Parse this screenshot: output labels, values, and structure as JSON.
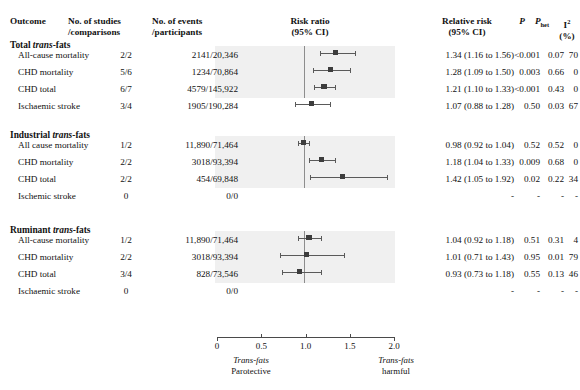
{
  "header": {
    "outcome": "Outcome",
    "studies_l1": "No. of studies",
    "studies_l2": "/comparisons",
    "events_l1": "No. of events",
    "events_l2": "/participants",
    "risk_l1": "Risk ratio",
    "risk_l2": "(95% CI)",
    "rr_l1": "Relative risk",
    "rr_l2": "(95% CI)",
    "p": "P",
    "phet_main": "P",
    "phet_sub": "het",
    "i2_main": "I",
    "i2_sup": "2",
    "i2_l2": "(%)"
  },
  "axis": {
    "ticks": [
      "0",
      "0.5",
      "1.0",
      "1.5",
      "2.0"
    ],
    "tick_values": [
      0,
      0.5,
      1.0,
      1.5,
      2.0
    ],
    "min": 0,
    "max": 2,
    "null_value": 1.0,
    "left_cap_l1": "Trans-fats",
    "left_cap_l2": "Parotective",
    "right_cap_l1": "Trans-fats",
    "right_cap_l2": "harmful"
  },
  "colors": {
    "panel_background": "#f0f0f0",
    "marker": "#3d3d3d",
    "ci_line": "#5a5a5a",
    "null_line": "#8d8d8d",
    "text": "#111111"
  },
  "chart_data": {
    "type": "forest",
    "title": "Risk ratio (95% CI)",
    "xlabel": "Risk ratio",
    "xlim": [
      0,
      2
    ],
    "null_line": 1.0,
    "groups": [
      {
        "title_bold": "Total ",
        "title_italic": "trans",
        "title_tail": "-fats",
        "rows": [
          {
            "outcome": "All-cause mortality",
            "studies": "2/2",
            "events": "2141/20,346",
            "rr_text": "1.34 (1.16 to 1.56)",
            "estimate": 1.34,
            "lower": 1.16,
            "upper": 1.56,
            "p": "<0.001",
            "phet": "0.07",
            "i2": "70"
          },
          {
            "outcome": "CHD mortality",
            "studies": "5/6",
            "events": "1234/70,864",
            "rr_text": "1.28 (1.09 to 1.50)",
            "estimate": 1.28,
            "lower": 1.09,
            "upper": 1.5,
            "p": "0.003",
            "phet": "0.66",
            "i2": "0"
          },
          {
            "outcome": "CHD total",
            "studies": "6/7",
            "events": "4579/145,922",
            "rr_text": "1.21 (1.10 to 1.33)",
            "estimate": 1.21,
            "lower": 1.1,
            "upper": 1.33,
            "p": "<0.001",
            "phet": "0.43",
            "i2": "0"
          },
          {
            "outcome": "Ischaemic stroke",
            "studies": "3/4",
            "events": "1905/190,284",
            "rr_text": "1.07 (0.88 to 1.28)",
            "estimate": 1.07,
            "lower": 0.88,
            "upper": 1.28,
            "p": "0.50",
            "phet": "0.03",
            "i2": "67"
          }
        ]
      },
      {
        "title_bold": "Industrial ",
        "title_italic": "trans",
        "title_tail": "-fats",
        "rows": [
          {
            "outcome": "All cause mortality",
            "studies": "1/2",
            "events": "11,890/71,464",
            "rr_text": "0.98 (0.92 to 1.04)",
            "estimate": 0.98,
            "lower": 0.92,
            "upper": 1.04,
            "p": "0.52",
            "phet": "0.52",
            "i2": "0"
          },
          {
            "outcome": "CHD mortality",
            "studies": "2/2",
            "events": "3018/93,394",
            "rr_text": "1.18 (1.04 to 1.33)",
            "estimate": 1.18,
            "lower": 1.04,
            "upper": 1.33,
            "p": "0.009",
            "phet": "0.68",
            "i2": "0"
          },
          {
            "outcome": "CHD total",
            "studies": "2/2",
            "events": "454/69,848",
            "rr_text": "1.42 (1.05 to 1.92)",
            "estimate": 1.42,
            "lower": 1.05,
            "upper": 1.92,
            "p": "0.02",
            "phet": "0.22",
            "i2": "34"
          },
          {
            "outcome": "Ischemic stroke",
            "studies": "0",
            "events": "0/0",
            "rr_text": "-",
            "estimate": null,
            "lower": null,
            "upper": null,
            "p": "-",
            "phet": "-",
            "i2": "-"
          }
        ]
      },
      {
        "title_bold": "Ruminant ",
        "title_italic": "trans",
        "title_tail": "-fats",
        "rows": [
          {
            "outcome": "All-cause mortality",
            "studies": "1/2",
            "events": "11,890/71,464",
            "rr_text": "1.04 (0.92 to 1.18)",
            "estimate": 1.04,
            "lower": 0.92,
            "upper": 1.18,
            "p": "0.51",
            "phet": "0.31",
            "i2": "4"
          },
          {
            "outcome": "CHD mortality",
            "studies": "2/2",
            "events": "3018/93,394",
            "rr_text": "1.01 (0.71 to 1.43)",
            "estimate": 1.01,
            "lower": 0.71,
            "upper": 1.43,
            "p": "0.95",
            "phet": "0.01",
            "i2": "79"
          },
          {
            "outcome": "CHD total",
            "studies": "3/4",
            "events": "828/73,546",
            "rr_text": "0.93 (0.73 to 1.18)",
            "estimate": 0.93,
            "lower": 0.73,
            "upper": 1.18,
            "p": "0.55",
            "phet": "0.13",
            "i2": "46"
          },
          {
            "outcome": "Ischaemic stroke",
            "studies": "0",
            "events": "0/0",
            "rr_text": "-",
            "estimate": null,
            "lower": null,
            "upper": null,
            "p": "-",
            "phet": "-",
            "i2": "-"
          }
        ]
      }
    ]
  }
}
